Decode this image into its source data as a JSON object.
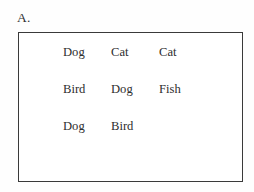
{
  "figure": {
    "panel_label": "A.",
    "border_color": "#3a3a3a",
    "text_color": "#2e2e2e",
    "background_color": "#ffffff"
  },
  "chart_data": {
    "type": "table",
    "title": "A.",
    "xlabel": "",
    "ylabel": "",
    "columns": [
      "",
      "",
      ""
    ],
    "rows": [
      [
        "Dog",
        "Cat",
        "Cat"
      ],
      [
        "Bird",
        "Dog",
        "Fish"
      ],
      [
        "Dog",
        "Bird",
        ""
      ]
    ],
    "word_counts": {
      "Dog": 3,
      "Cat": 2,
      "Bird": 2,
      "Fish": 1
    },
    "grid": {
      "columns": 3,
      "rows": 3,
      "filled_cells": 8,
      "empty_cells": 1
    },
    "annotations": [
      "A."
    ],
    "legend": [],
    "grid_lines": false
  }
}
